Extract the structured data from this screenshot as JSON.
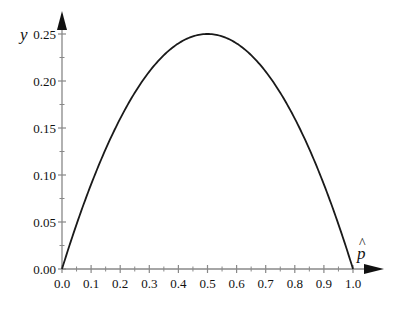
{
  "chart_data": {
    "type": "line",
    "title": "",
    "xlabel": "p̂",
    "ylabel": "y",
    "function": "y = p̂(1 - p̂)",
    "xlim": [
      0.0,
      1.0
    ],
    "ylim": [
      0.0,
      0.25
    ],
    "grid": false,
    "legend": null,
    "x_ticks": [
      "0.0",
      "0.1",
      "0.2",
      "0.3",
      "0.4",
      "0.5",
      "0.6",
      "0.7",
      "0.8",
      "0.9",
      "1.0"
    ],
    "y_ticks": [
      "0.00",
      "0.05",
      "0.10",
      "0.15",
      "0.20",
      "0.25"
    ],
    "series": [
      {
        "name": "y",
        "color": "#1a1a1a",
        "x": [
          0.0,
          0.05,
          0.1,
          0.15,
          0.2,
          0.25,
          0.3,
          0.35,
          0.4,
          0.45,
          0.5,
          0.55,
          0.6,
          0.65,
          0.7,
          0.75,
          0.8,
          0.85,
          0.9,
          0.95,
          1.0
        ],
        "y": [
          0.0,
          0.0475,
          0.09,
          0.1275,
          0.16,
          0.1875,
          0.21,
          0.2275,
          0.24,
          0.2475,
          0.25,
          0.2475,
          0.24,
          0.2275,
          0.21,
          0.1875,
          0.16,
          0.1275,
          0.09,
          0.0475,
          0.0
        ]
      }
    ]
  },
  "colors": {
    "axis": "#888888",
    "curve": "#1a1a1a",
    "arrow": "#111111"
  }
}
